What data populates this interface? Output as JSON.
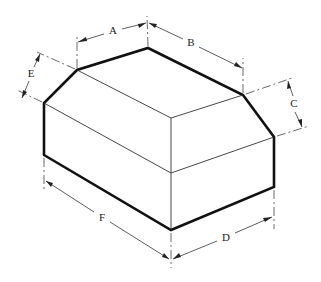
{
  "figure": {
    "type": "isometric-dimensioned-drawing",
    "labels": {
      "A": "A",
      "B": "B",
      "C": "C",
      "D": "D",
      "E": "E",
      "F": "F"
    }
  }
}
